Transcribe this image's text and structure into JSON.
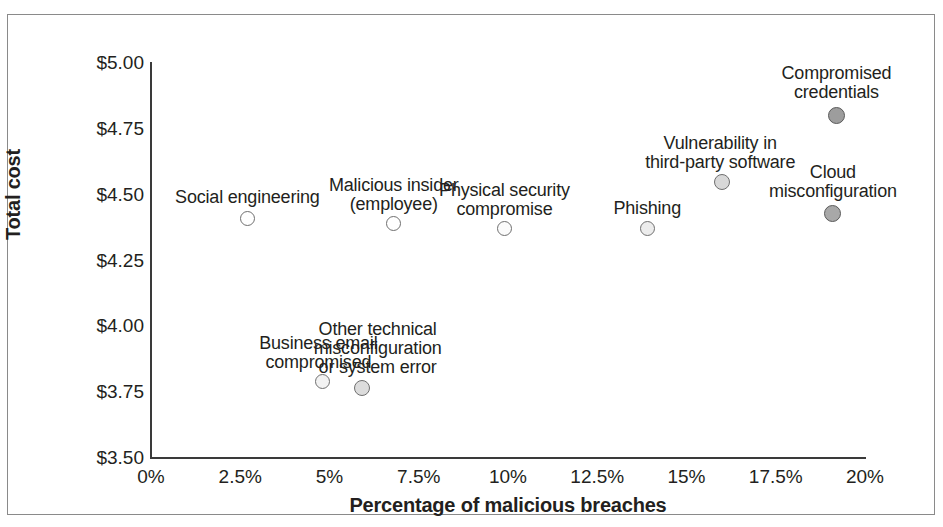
{
  "chart_data": {
    "type": "scatter",
    "title": "",
    "xlabel": "Percentage of malicious breaches",
    "ylabel": "Total cost",
    "xlim": [
      0,
      20
    ],
    "ylim": [
      3.5,
      5.0
    ],
    "grid": false,
    "legend": "none",
    "xticks": [
      "0%",
      "2.5%",
      "5%",
      "7.5%",
      "10%",
      "12.5%",
      "15%",
      "17.5%",
      "20%"
    ],
    "xtick_values": [
      0,
      2.5,
      5,
      7.5,
      10,
      12.5,
      15,
      17.5,
      20
    ],
    "yticks": [
      "$3.50",
      "$3.75",
      "$4.00",
      "$4.25",
      "$4.50",
      "$4.75",
      "$5.00"
    ],
    "ytick_values": [
      3.5,
      3.75,
      4.0,
      4.25,
      4.5,
      4.75,
      5.0
    ],
    "points": [
      {
        "label": "Social engineering",
        "label_lines": [
          "Social engineering"
        ],
        "x": 2.7,
        "y": 4.41,
        "marker_size": 15,
        "marker_fill": "#ffffff",
        "marker_stroke": "#6f6f6f",
        "label_dx": 0,
        "label_dy": -30
      },
      {
        "label": "Malicious insider (employee)",
        "label_lines": [
          "Malicious insider",
          "(employee)"
        ],
        "x": 6.8,
        "y": 4.39,
        "marker_size": 15,
        "marker_fill": "#ffffff",
        "marker_stroke": "#6f6f6f",
        "label_dx": 0,
        "label_dy": -48
      },
      {
        "label": "Physical security compromise",
        "label_lines": [
          "Physical security",
          "compromise"
        ],
        "x": 9.9,
        "y": 4.37,
        "marker_size": 15,
        "marker_fill": "#fbfbfb",
        "marker_stroke": "#6f6f6f",
        "label_dx": 0,
        "label_dy": -48
      },
      {
        "label": "Phishing",
        "label_lines": [
          "Phishing"
        ],
        "x": 13.9,
        "y": 4.37,
        "marker_size": 15,
        "marker_fill": "#ececec",
        "marker_stroke": "#6f6f6f",
        "label_dx": 0,
        "label_dy": -30
      },
      {
        "label": "Vulnerability in third-party software",
        "label_lines": [
          "Vulnerability in",
          "third-party software"
        ],
        "x": 16.0,
        "y": 4.55,
        "marker_size": 16,
        "marker_fill": "#d8d8d8",
        "marker_stroke": "#6f6f6f",
        "label_dx": -2,
        "label_dy": -48
      },
      {
        "label": "Compromised credentials",
        "label_lines": [
          "Compromised",
          "credentials"
        ],
        "x": 19.2,
        "y": 4.8,
        "marker_size": 17,
        "marker_fill": "#9d9d9d",
        "marker_stroke": "#5a5a5a",
        "label_dx": 0,
        "label_dy": -52
      },
      {
        "label": "Cloud misconfiguration",
        "label_lines": [
          "Cloud",
          "misconfiguration"
        ],
        "x": 19.1,
        "y": 4.43,
        "marker_size": 17,
        "marker_fill": "#a8a8a8",
        "marker_stroke": "#5a5a5a",
        "label_dx": 0,
        "label_dy": -50
      },
      {
        "label": "Business email compromised",
        "label_lines": [
          "Business email",
          "compromised"
        ],
        "x": 4.8,
        "y": 3.79,
        "marker_size": 15,
        "marker_fill": "#f2f2f2",
        "marker_stroke": "#6f6f6f",
        "label_dx": -4,
        "label_dy": -48
      },
      {
        "label": "Other technical misconfiguration or system error",
        "label_lines": [
          "Other technical",
          "misconfiguration",
          "or system error"
        ],
        "x": 5.9,
        "y": 3.765,
        "marker_size": 16,
        "marker_fill": "#dcdcdc",
        "marker_stroke": "#6f6f6f",
        "label_dx": 16,
        "label_dy": -68
      }
    ],
    "colors": {
      "axis": "#3a3a3a",
      "frame": "#8a8a8a",
      "text": "#231f20",
      "background": "#ffffff"
    }
  }
}
